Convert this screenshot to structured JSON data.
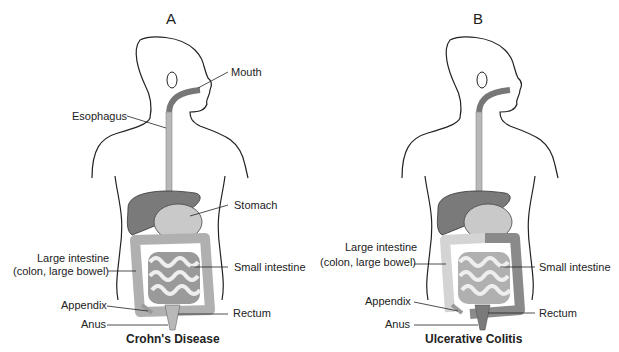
{
  "panels": [
    {
      "letter": "A",
      "caption": "Crohn's Disease",
      "labels": {
        "mouth": "Mouth",
        "esophagus": "Esophagus",
        "stomach": "Stomach",
        "large_intestine_1": "Large intestine",
        "large_intestine_2": "(colon, large bowel)",
        "small_intestine": "Small intestine",
        "appendix": "Appendix",
        "rectum": "Rectum",
        "anus": "Anus"
      }
    },
    {
      "letter": "B",
      "caption": "Ulcerative Colitis",
      "labels": {
        "large_intestine_1": "Large intestine",
        "large_intestine_2": "(colon, large bowel)",
        "small_intestine": "Small intestine",
        "appendix": "Appendix",
        "rectum": "Rectum",
        "anus": "Anus"
      }
    }
  ],
  "colors": {
    "outline": "#222222",
    "esophagus": "#b8b8b8",
    "liver": "#7a7a7a",
    "stomach": "#c9c9c9",
    "colon_light": "#d4d4d4",
    "colon_dark_uc": "#8a8a8a",
    "small_intestine": "#eeeeee"
  }
}
